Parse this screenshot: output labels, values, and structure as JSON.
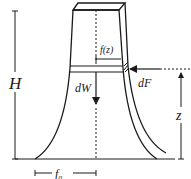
{
  "diagram": {
    "type": "tower-cross-section",
    "labels": {
      "height": "H",
      "profile": "f(z)",
      "weight_increment": "dW",
      "force_increment": "dF",
      "elevation": "z",
      "base_half_width": "f₀"
    },
    "colors": {
      "stroke": "#1a1a1a",
      "background": "#ffffff"
    }
  }
}
